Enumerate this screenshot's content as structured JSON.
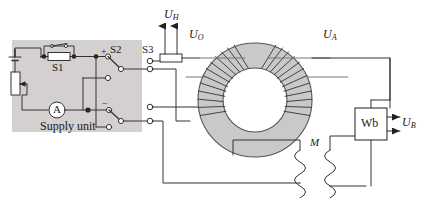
{
  "figure": {
    "type": "circuit-diagram",
    "colors": {
      "line": "#333333",
      "core_fill": "#c9c9c9",
      "core_stroke": "#555555",
      "panel_fill": "#d4d0d0",
      "background": "#ffffff",
      "text": "#1a1a1a"
    }
  },
  "supply_unit": {
    "panel_label": "Supply unit",
    "ammeter_label": "A",
    "switch_s1_label": "S1",
    "switch_s2_label": "S2",
    "s2_terminal_plus": "+",
    "s2_terminal_minus": "−"
  },
  "terminal_block": {
    "label": "S3"
  },
  "signals": {
    "hall_voltage": {
      "symbol": "U",
      "subscript": "H"
    },
    "primary_voltage": {
      "symbol": "U",
      "subscript": "O"
    },
    "secondary_voltage": {
      "symbol": "U",
      "subscript": "A"
    },
    "flux_voltage": {
      "symbol": "U",
      "subscript": "B"
    }
  },
  "components": {
    "mutual_inductor_label": "M",
    "fluxmeter_label": "Wb"
  }
}
